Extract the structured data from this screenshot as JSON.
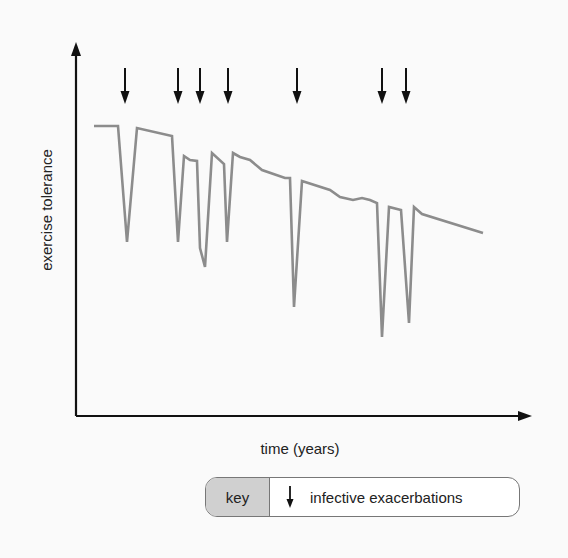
{
  "chart_data": {
    "type": "line",
    "title": "",
    "xlabel": "time (years)",
    "ylabel": "exercise tolerance",
    "grid": false,
    "axis_ticks": "none",
    "line_color": "#8c8c8c",
    "series": [
      {
        "name": "exercise tolerance",
        "points_px": [
          [
            94,
            126
          ],
          [
            118,
            126
          ],
          [
            127,
            242
          ],
          [
            137,
            128
          ],
          [
            172,
            136
          ],
          [
            178,
            242
          ],
          [
            184,
            156
          ],
          [
            190,
            160
          ],
          [
            197,
            161
          ],
          [
            200,
            248
          ],
          [
            205,
            267
          ],
          [
            212,
            153
          ],
          [
            224,
            164
          ],
          [
            227,
            242
          ],
          [
            233,
            153
          ],
          [
            240,
            157
          ],
          [
            250,
            160
          ],
          [
            262,
            170
          ],
          [
            285,
            178
          ],
          [
            290,
            178
          ],
          [
            294,
            307
          ],
          [
            302,
            181
          ],
          [
            330,
            190
          ],
          [
            340,
            197
          ],
          [
            353,
            200
          ],
          [
            362,
            198
          ],
          [
            370,
            200
          ],
          [
            377,
            203
          ],
          [
            382,
            337
          ],
          [
            389,
            207
          ],
          [
            401,
            210
          ],
          [
            409,
            323
          ],
          [
            414,
            207
          ],
          [
            422,
            214
          ],
          [
            483,
            233
          ]
        ]
      }
    ],
    "annotations": {
      "exacerbation_arrows_x_px": [
        125,
        178,
        200,
        228,
        297,
        382,
        406
      ],
      "arrow_y_top_px": 68,
      "arrow_y_bottom_px": 104
    },
    "legend": {
      "position": "bottom-right",
      "entries": [
        {
          "symbol": "down-arrow",
          "label": "infective exacerbations"
        }
      ]
    }
  },
  "axes": {
    "x_label": "time (years)",
    "y_label": "exercise tolerance"
  },
  "key": {
    "title": "key",
    "entry_label": "infective exacerbations"
  }
}
